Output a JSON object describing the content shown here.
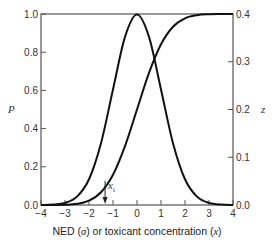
{
  "chart_data": {
    "type": "line",
    "title": "",
    "xlabel": "NED (σ) or toxicant concentration (x)",
    "xlabel_parts": [
      "NED (",
      "σ",
      ") or toxicant concentration (",
      "x",
      ")"
    ],
    "ylabel_left": "P",
    "ylabel_right": "z",
    "xlim": [
      -4,
      4
    ],
    "ylim_left": [
      0.0,
      1.0
    ],
    "ylim_right": [
      0.0,
      0.4
    ],
    "x_ticks": [
      "−4",
      "−3",
      "−2",
      "−1",
      "0",
      "1",
      "2",
      "3",
      "4"
    ],
    "y_ticks_left": [
      "0.0",
      "0.2",
      "0.4",
      "0.6",
      "0.8",
      "1.0"
    ],
    "y_ticks_right": [
      "0.0",
      "0.1",
      "0.2",
      "0.3",
      "0.4"
    ],
    "grid": false,
    "legend": null,
    "x": [
      -4.0,
      -3.5,
      -3.0,
      -2.5,
      -2.0,
      -1.5,
      -1.0,
      -0.5,
      0.0,
      0.5,
      1.0,
      1.5,
      2.0,
      2.5,
      3.0,
      3.5,
      4.0
    ],
    "series": [
      {
        "name": "Cumulative probability P (sigmoid)",
        "axis": "left",
        "values": [
          0.0,
          0.0002,
          0.0013,
          0.0062,
          0.0228,
          0.0668,
          0.1587,
          0.3085,
          0.5,
          0.6915,
          0.8413,
          0.9332,
          0.9772,
          0.9938,
          0.9987,
          0.9998,
          1.0
        ]
      },
      {
        "name": "Frequency z (normal curve)",
        "axis": "right",
        "values": [
          0.0001,
          0.0009,
          0.0044,
          0.0175,
          0.054,
          0.1295,
          0.242,
          0.3521,
          0.3989,
          0.3521,
          0.242,
          0.1295,
          0.054,
          0.0175,
          0.0044,
          0.0009,
          0.0001
        ]
      }
    ],
    "annotations": [
      {
        "label": "x",
        "subscript": "i",
        "x": -1.33,
        "type": "down-arrow"
      }
    ]
  }
}
